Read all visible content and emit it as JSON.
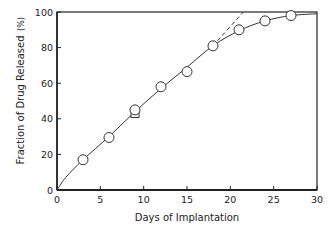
{
  "chart_data": {
    "type": "line",
    "title": "",
    "xlabel": "Days of Implantation",
    "ylabel": "Fraction of Drug Released",
    "ylabel_unit": "(%)",
    "xlim": [
      0,
      30
    ],
    "ylim": [
      0,
      100
    ],
    "xticks": [
      0,
      5,
      10,
      15,
      20,
      25,
      30
    ],
    "yticks": [
      0,
      20,
      40,
      60,
      80,
      100
    ],
    "grid": false,
    "legend": null,
    "series": [
      {
        "name": "observed",
        "marker": "circle",
        "x": [
          3,
          6,
          9,
          12,
          15,
          18,
          21,
          24,
          27
        ],
        "y": [
          17,
          29.5,
          45,
          58,
          66.5,
          81,
          90,
          95,
          98
        ]
      },
      {
        "name": "observed (square marker)",
        "marker": "square",
        "x": [
          9
        ],
        "y": [
          43
        ]
      },
      {
        "name": "fitted curve",
        "style": "solid",
        "x": [
          0,
          1,
          3,
          6,
          9,
          12,
          15,
          18,
          21,
          24,
          27,
          30
        ],
        "y": [
          0,
          7,
          17,
          30,
          44,
          57,
          69,
          81,
          89.5,
          95,
          98,
          99
        ]
      },
      {
        "name": "linear extrapolation",
        "style": "dashed",
        "x": [
          18,
          21.5
        ],
        "y": [
          81,
          100
        ]
      }
    ]
  }
}
